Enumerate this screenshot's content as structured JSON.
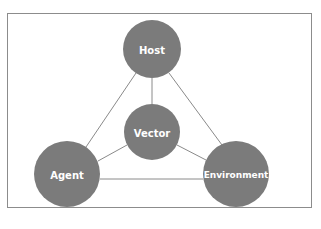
{
  "diagram": {
    "type": "network",
    "nodes": [
      {
        "id": "host",
        "label": "Host",
        "cx": 152,
        "cy": 49,
        "r": 29
      },
      {
        "id": "vector",
        "label": "Vector",
        "cx": 152,
        "cy": 132,
        "r": 28
      },
      {
        "id": "agent",
        "label": "Agent",
        "cx": 67,
        "cy": 174,
        "r": 33
      },
      {
        "id": "environment",
        "label": "Environment",
        "cx": 236,
        "cy": 174,
        "r": 33
      }
    ],
    "edges": [
      [
        "host",
        "agent"
      ],
      [
        "host",
        "environment"
      ],
      [
        "host",
        "vector"
      ],
      [
        "vector",
        "agent"
      ],
      [
        "vector",
        "environment"
      ],
      [
        "agent",
        "environment"
      ]
    ],
    "colors": {
      "node_fill": "#7b7b7b",
      "edge": "#8a8a8a",
      "label": "#ffffff"
    }
  }
}
